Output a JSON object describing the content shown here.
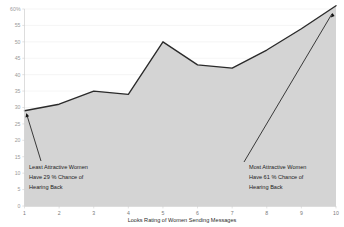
{
  "chart_data": {
    "type": "area",
    "title": "",
    "xlabel": "Looks Rating of Women Sending Messages",
    "ylabel": "",
    "x": [
      1,
      2,
      3,
      4,
      5,
      6,
      7,
      8,
      9,
      10
    ],
    "categories": [
      "1",
      "2",
      "3",
      "4",
      "5",
      "6",
      "7",
      "8",
      "9",
      "10"
    ],
    "values": [
      29,
      31,
      35,
      34,
      50,
      43,
      42,
      47.5,
      54,
      61
    ],
    "series": [
      {
        "name": "Chance of Hearing Back",
        "values": [
          29,
          31,
          35,
          34,
          50,
          43,
          42,
          47.5,
          54,
          61
        ]
      }
    ],
    "xlim": [
      1,
      10
    ],
    "ylim": [
      0,
      60
    ],
    "ytick_labels": [
      "60%",
      "55",
      "50",
      "45",
      "40",
      "35",
      "30",
      "25",
      "20",
      "15",
      "10",
      "5",
      "0"
    ],
    "ytick_values": [
      60,
      55,
      50,
      45,
      40,
      35,
      30,
      25,
      20,
      15,
      10,
      5,
      0
    ],
    "xtick_labels": [
      "1",
      "2",
      "3",
      "4",
      "5",
      "6",
      "7",
      "8",
      "9",
      "10"
    ],
    "grid": true,
    "legend": "none",
    "line_color": "#2a2a2a",
    "fill_color": "#d0d0d0",
    "background_color": "#ffffff",
    "annotations": [
      {
        "id": "least-attractive",
        "lines": [
          "Least Attractive Women",
          "Have 29 % Chance of",
          "Hearing Back"
        ],
        "line1": "Least Attractive Women",
        "line2": "Have 29 % Chance of",
        "line3": "Hearing Back",
        "points_to_x": 1,
        "points_to_y": 29
      },
      {
        "id": "most-attractive",
        "lines": [
          "Most Attractive Women",
          "Have 61 % Chance of",
          "Hearing Back"
        ],
        "line1": "Most Attractive Women",
        "line2": "Have 61 % Chance of",
        "line3": "Hearing Back",
        "points_to_x": 10,
        "points_to_y": 61
      }
    ]
  }
}
